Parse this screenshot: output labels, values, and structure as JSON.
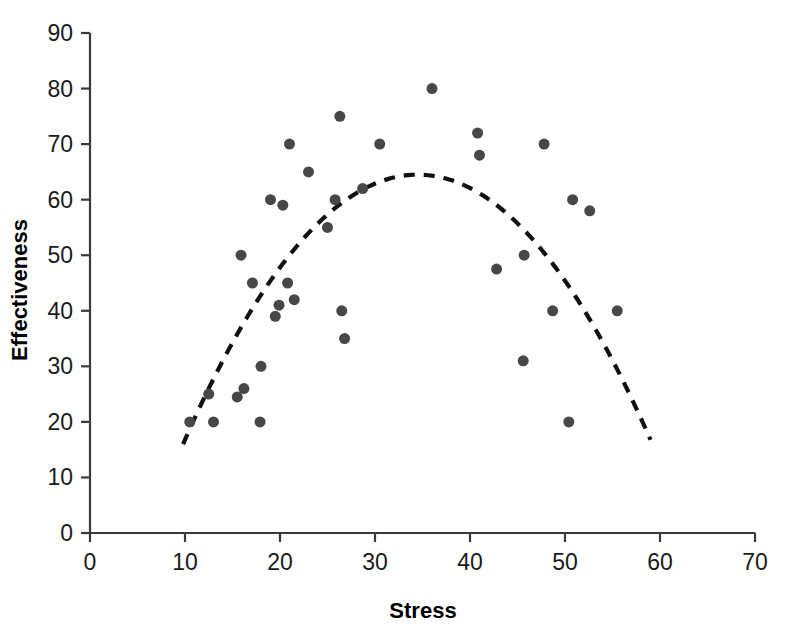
{
  "chart_data": {
    "type": "scatter",
    "title": "",
    "xlabel": "Stress",
    "ylabel": "Effectiveness",
    "xlim": [
      0,
      70
    ],
    "ylim": [
      0,
      90
    ],
    "xticks": [
      0,
      10,
      20,
      30,
      40,
      50,
      60,
      70
    ],
    "yticks": [
      0,
      10,
      20,
      30,
      40,
      50,
      60,
      70,
      80,
      90
    ],
    "grid": false,
    "legend": null,
    "marker": {
      "shape": "circle",
      "color": "#474747",
      "size_px": 11
    },
    "points": [
      {
        "x": 10.5,
        "y": 20
      },
      {
        "x": 12.5,
        "y": 25
      },
      {
        "x": 13.0,
        "y": 20
      },
      {
        "x": 15.5,
        "y": 24.5
      },
      {
        "x": 15.9,
        "y": 50
      },
      {
        "x": 16.2,
        "y": 26
      },
      {
        "x": 17.1,
        "y": 45
      },
      {
        "x": 17.9,
        "y": 20
      },
      {
        "x": 18.0,
        "y": 30
      },
      {
        "x": 19.0,
        "y": 60
      },
      {
        "x": 19.9,
        "y": 41
      },
      {
        "x": 19.5,
        "y": 39
      },
      {
        "x": 20.3,
        "y": 59
      },
      {
        "x": 20.8,
        "y": 45
      },
      {
        "x": 21.0,
        "y": 70
      },
      {
        "x": 21.5,
        "y": 42
      },
      {
        "x": 23.0,
        "y": 65
      },
      {
        "x": 25.0,
        "y": 55
      },
      {
        "x": 25.8,
        "y": 60
      },
      {
        "x": 26.3,
        "y": 75
      },
      {
        "x": 26.5,
        "y": 40
      },
      {
        "x": 26.8,
        "y": 35
      },
      {
        "x": 28.7,
        "y": 62
      },
      {
        "x": 30.5,
        "y": 70
      },
      {
        "x": 36.0,
        "y": 80
      },
      {
        "x": 40.8,
        "y": 72
      },
      {
        "x": 41.0,
        "y": 68
      },
      {
        "x": 42.8,
        "y": 47.5
      },
      {
        "x": 45.7,
        "y": 50
      },
      {
        "x": 45.6,
        "y": 31
      },
      {
        "x": 47.8,
        "y": 70
      },
      {
        "x": 48.7,
        "y": 40
      },
      {
        "x": 50.4,
        "y": 20
      },
      {
        "x": 50.8,
        "y": 60
      },
      {
        "x": 52.6,
        "y": 58
      },
      {
        "x": 55.5,
        "y": 40
      }
    ],
    "fit_curve": {
      "style": "dashed",
      "color": "#111111",
      "description": "inverted-U quadratic trend line",
      "x_start": 9.8,
      "x_end": 59.0,
      "peak_x": 34.5,
      "peak_y": 64.5,
      "y_start": 16.0,
      "y_end": 20.5
    }
  }
}
